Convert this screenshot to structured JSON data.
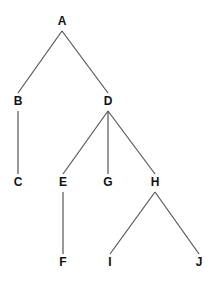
{
  "diagram": {
    "type": "tree",
    "nodes": [
      {
        "id": "A",
        "label": "A",
        "x": 62,
        "y": 22
      },
      {
        "id": "B",
        "label": "B",
        "x": 18,
        "y": 102
      },
      {
        "id": "D",
        "label": "D",
        "x": 108,
        "y": 102
      },
      {
        "id": "C",
        "label": "C",
        "x": 18,
        "y": 183
      },
      {
        "id": "E",
        "label": "E",
        "x": 63,
        "y": 183
      },
      {
        "id": "G",
        "label": "G",
        "x": 108,
        "y": 183
      },
      {
        "id": "H",
        "label": "H",
        "x": 155,
        "y": 183
      },
      {
        "id": "F",
        "label": "F",
        "x": 63,
        "y": 263
      },
      {
        "id": "I",
        "label": "I",
        "x": 110,
        "y": 263
      },
      {
        "id": "J",
        "label": "J",
        "x": 199,
        "y": 263
      }
    ],
    "edges": [
      {
        "from": "A",
        "to": "B"
      },
      {
        "from": "A",
        "to": "D"
      },
      {
        "from": "B",
        "to": "C"
      },
      {
        "from": "D",
        "to": "E"
      },
      {
        "from": "D",
        "to": "G"
      },
      {
        "from": "D",
        "to": "H"
      },
      {
        "from": "E",
        "to": "F"
      },
      {
        "from": "H",
        "to": "I"
      },
      {
        "from": "H",
        "to": "J"
      }
    ]
  }
}
